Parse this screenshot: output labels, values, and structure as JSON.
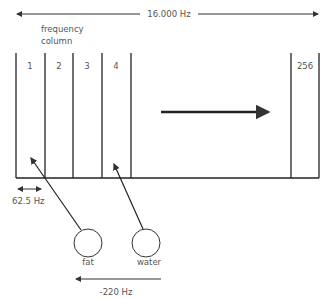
{
  "diagram": {
    "total_bandwidth_label": "16.000 Hz",
    "column_caption_line1": "frequency",
    "column_caption_line2": "column",
    "columns": [
      {
        "label": "1"
      },
      {
        "label": "2"
      },
      {
        "label": "3"
      },
      {
        "label": "4"
      },
      {
        "label": "256"
      }
    ],
    "column_width_label": "62.5 Hz",
    "circles": [
      {
        "label": "fat"
      },
      {
        "label": "water"
      }
    ],
    "shift_label": "-220 Hz",
    "colors": {
      "line": "#222222",
      "text": "#555555",
      "background": "#ffffff"
    }
  }
}
